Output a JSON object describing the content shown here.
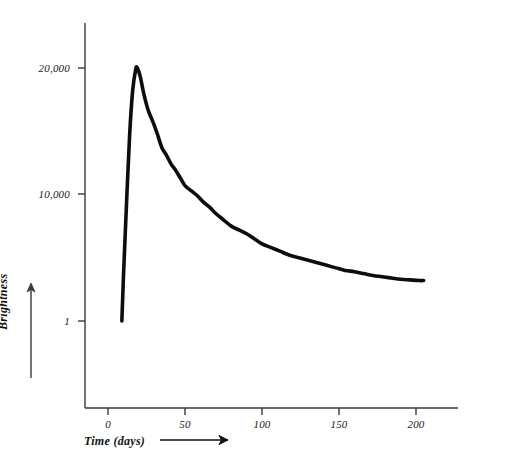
{
  "figure": {
    "background_color": "#ffffff",
    "ink_color": "#0d0d0d",
    "axis_color": "#3a3a3a"
  },
  "chart_data": {
    "type": "line",
    "title": "",
    "subtitle": "",
    "xlabel": "Time (days)",
    "ylabel": "Brightness",
    "xlim": [
      -15,
      215
    ],
    "ylim": [
      0,
      23000
    ],
    "grid": false,
    "legend": null,
    "legend_position": "none",
    "xticks": [
      0,
      50,
      100,
      150,
      200
    ],
    "xticklabels": [
      "0",
      "50",
      "100",
      "150",
      "200"
    ],
    "yticks": [
      1,
      10000,
      20000
    ],
    "yticklabels": [
      "1",
      "10,000",
      "20,000"
    ],
    "annotations": [],
    "series": [
      {
        "name": "Brightness",
        "line_color": "#0d0d0d",
        "line_width": 3.6,
        "x": [
          9,
          10,
          12,
          14,
          16,
          18,
          19,
          21,
          23,
          26,
          29,
          32,
          35,
          38,
          41,
          44,
          47,
          50,
          54,
          58,
          62,
          66,
          70,
          75,
          80,
          85,
          90,
          95,
          100,
          106,
          112,
          118,
          124,
          130,
          136,
          142,
          148,
          154,
          160,
          166,
          172,
          178,
          184,
          190,
          196,
          202,
          205
        ],
        "y": [
          1,
          3400,
          9200,
          14600,
          18200,
          19900,
          20000,
          19300,
          18100,
          16700,
          15800,
          14800,
          13700,
          13100,
          12400,
          11900,
          11300,
          10700,
          10300,
          9900,
          9400,
          9000,
          8500,
          8000,
          7500,
          7200,
          6900,
          6500,
          6100,
          5800,
          5500,
          5200,
          5000,
          4800,
          4600,
          4400,
          4200,
          4000,
          3900,
          3750,
          3600,
          3500,
          3400,
          3300,
          3250,
          3200,
          3200
        ]
      }
    ]
  }
}
